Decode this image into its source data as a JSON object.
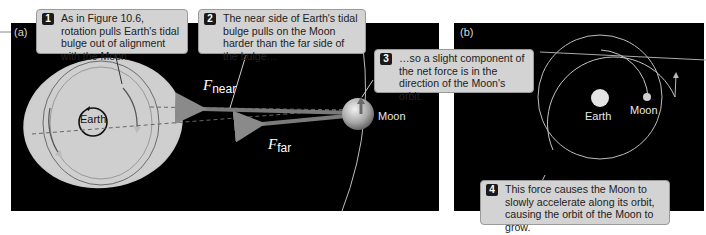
{
  "panels": {
    "a": {
      "label": "(a)",
      "earth_label": "Earth",
      "moon_label": "Moon",
      "force_near": {
        "symbol": "F",
        "subscript": "near"
      },
      "force_far": {
        "symbol": "F",
        "subscript": "far"
      }
    },
    "b": {
      "label": "(b)",
      "earth_label": "Earth",
      "moon_label": "Moon"
    }
  },
  "callouts": [
    {
      "number": "1",
      "text": "As in Figure 10.6, rotation pulls Earth's tidal bulge out of alignment with the Moon."
    },
    {
      "number": "2",
      "text": "The near side of Earth's tidal bulge pulls on the Moon harder than the far side of the bulge…"
    },
    {
      "number": "3",
      "text": "…so a slight component of the net force is in the direction of the Moon's orbit."
    },
    {
      "number": "4",
      "text": "This force causes the Moon to slowly accelerate along its orbit, causing the orbit of the Moon to grow."
    }
  ],
  "colors": {
    "background": "#000000",
    "bulge": "#c8c8c8",
    "callout_bg": "#d3d3d3",
    "arrow": "#6e6e6e",
    "orbit_line": "#b0b0b0"
  }
}
